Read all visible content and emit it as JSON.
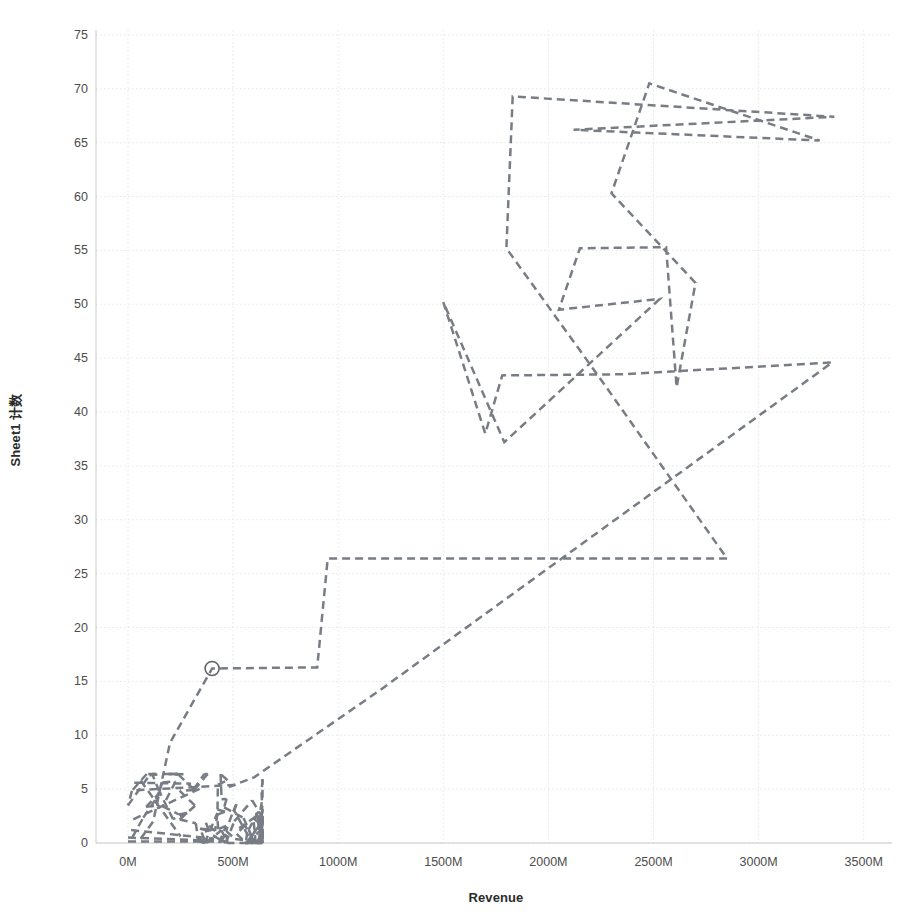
{
  "chart_data": {
    "type": "line",
    "title": "",
    "subtitle": "",
    "xlabel": "Revenue",
    "ylabel": "Sheet1 计数",
    "xlim": [
      -150000000,
      3700000000
    ],
    "ylim": [
      -2,
      76.5
    ],
    "grid": true,
    "legend": null,
    "legend_position": "none",
    "line_style": "dashed",
    "line_color": "#787d85",
    "line_width": 2.5,
    "marker": "open-circle",
    "annotations": [],
    "x_tick_labels": [
      "0M",
      "500M",
      "1000M",
      "1500M",
      "2000M",
      "2500M",
      "3000M",
      "3500M"
    ],
    "x_tick_values": [
      0,
      500,
      1000,
      1500,
      2000,
      2500,
      3000,
      3500
    ],
    "x_tick_unit": "M",
    "y_tick_labels": [
      "0",
      "5",
      "10",
      "15",
      "20",
      "25",
      "30",
      "35",
      "40",
      "45",
      "50",
      "55",
      "60",
      "65",
      "70",
      "75"
    ],
    "y_tick_values": [
      0,
      5,
      10,
      15,
      20,
      25,
      30,
      35,
      40,
      45,
      50,
      55,
      60,
      65,
      70,
      75
    ],
    "marker_points": [
      {
        "x": 400,
        "y": 16.2,
        "label": ""
      }
    ],
    "series": [
      {
        "name": "Sheet1 计数 vs Revenue",
        "x": [
          1830,
          3360,
          2120,
          3290,
          2480,
          2300,
          2150,
          2560,
          2700,
          2610,
          1800,
          2530,
          2060,
          1780,
          2640,
          1900,
          2350,
          2490,
          2290,
          3350,
          2850,
          950,
          900,
          400,
          200,
          1200,
          600,
          480,
          120,
          60,
          1500,
          1700,
          1790,
          2050,
          2250
        ],
        "y": [
          69.3,
          67.4,
          66.2,
          65.2,
          70.5,
          60.3,
          55.2,
          55.3,
          52.0,
          42.3,
          55.2,
          50.5,
          49.6,
          43.4,
          51.9,
          39.6,
          43.5,
          44.9,
          31.5,
          44.6,
          26.4,
          26.4,
          16.3,
          16.2,
          9.3,
          14.2,
          6.1,
          5.2,
          2.0,
          0.4,
          50.2,
          38.0,
          37.2,
          49.5,
          43.0
        ]
      }
    ],
    "polyline_paths": [
      {
        "name": "main-path",
        "points": [
          [
            60,
            0.4
          ],
          [
            120,
            2.0
          ],
          [
            200,
            9.3
          ],
          [
            400,
            16.2
          ],
          [
            900,
            16.3
          ],
          [
            950,
            26.4
          ],
          [
            2850,
            26.4
          ],
          [
            2250,
            43.0
          ],
          [
            1800,
            55.2
          ],
          [
            1830,
            69.3
          ],
          [
            3360,
            67.4
          ],
          [
            2120,
            66.2
          ],
          [
            3290,
            65.2
          ],
          [
            2480,
            70.5
          ],
          [
            2300,
            60.3
          ],
          [
            2700,
            52.0
          ],
          [
            2610,
            42.3
          ],
          [
            2560,
            55.3
          ],
          [
            2150,
            55.2
          ],
          [
            2050,
            49.5
          ],
          [
            2530,
            50.5
          ],
          [
            1790,
            37.2
          ],
          [
            1500,
            50.2
          ],
          [
            1700,
            38.0
          ],
          [
            1780,
            43.4
          ],
          [
            2350,
            43.5
          ],
          [
            3350,
            44.6
          ],
          [
            1200,
            14.2
          ],
          [
            600,
            6.1
          ],
          [
            480,
            5.2
          ]
        ]
      }
    ]
  },
  "axes": {
    "y_title": "Sheet1 计数",
    "x_title": "Revenue"
  },
  "ticks": {
    "y": [
      "75",
      "70",
      "65",
      "60",
      "55",
      "50",
      "45",
      "40",
      "35",
      "30",
      "25",
      "20",
      "15",
      "10",
      "5",
      "0"
    ],
    "x": [
      "0M",
      "500M",
      "1000M",
      "1500M",
      "2000M",
      "2500M",
      "3000M",
      "3500M"
    ]
  },
  "colors": {
    "line": "#787d85",
    "grid": "#e6e6e6",
    "axis": "#bdbdbd",
    "text": "#4c4c4c",
    "title_text": "#2b2b2b",
    "background": "#ffffff"
  }
}
